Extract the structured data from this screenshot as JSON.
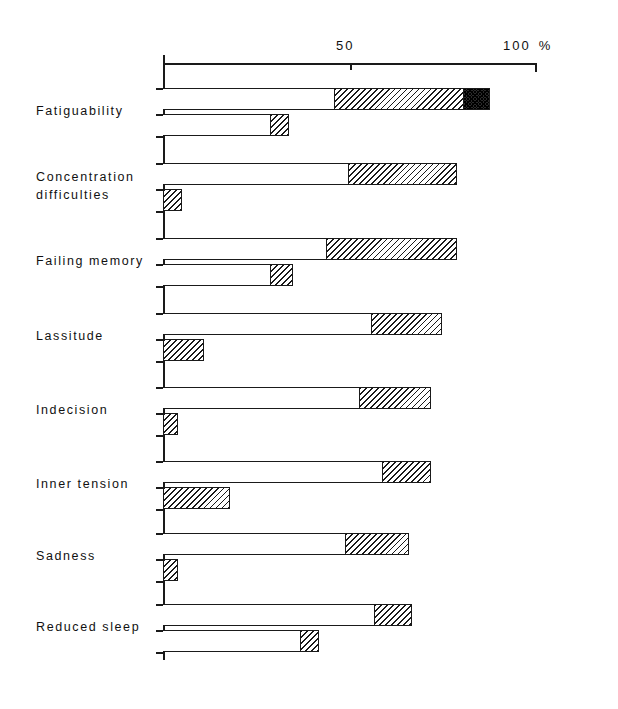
{
  "chart_data": {
    "type": "bar",
    "title": "",
    "subtitle": "",
    "xlabel": "%",
    "ylabel": "",
    "xlim": [
      0,
      100
    ],
    "xticks": [
      50,
      100
    ],
    "xticklabels": [
      "50",
      "100"
    ],
    "unit_label": "%",
    "grid": false,
    "legend_position": "none",
    "orientation": "horizontal",
    "stacked": true,
    "bars_per_category": 2,
    "segment_names": [
      "white",
      "hatched",
      "dark"
    ],
    "categories": [
      "Fatiguability",
      "Concentration difficulties",
      "Failing memory",
      "Lassitude",
      "Indecision",
      "Inner tension",
      "Sadness",
      "Reduced sleep"
    ],
    "category_lines": [
      [
        "Fatiguability"
      ],
      [
        "Concentration",
        "difficulties"
      ],
      [
        "Failing memory"
      ],
      [
        "Lassitude"
      ],
      [
        "Indecision"
      ],
      [
        "Inner tension"
      ],
      [
        "Sadness"
      ],
      [
        "Reduced sleep"
      ]
    ],
    "rows": [
      {
        "category": "Fatiguability",
        "upper": {
          "white_end": 46,
          "hatched_end": 81,
          "dark_end": 88,
          "total": 88
        },
        "lower": {
          "white_end": 29,
          "hatched_end": 34,
          "dark_end": 34,
          "total": 34
        }
      },
      {
        "category": "Concentration difficulties",
        "upper": {
          "white_end": 50,
          "hatched_end": 79,
          "dark_end": 79,
          "total": 79
        },
        "lower": {
          "white_end": 0,
          "hatched_end": 5,
          "dark_end": 5,
          "total": 5
        }
      },
      {
        "category": "Failing memory",
        "upper": {
          "white_end": 44,
          "hatched_end": 79,
          "dark_end": 79,
          "total": 79
        },
        "lower": {
          "white_end": 29,
          "hatched_end": 35,
          "dark_end": 35,
          "total": 35
        }
      },
      {
        "category": "Lassitude",
        "upper": {
          "white_end": 56,
          "hatched_end": 75,
          "dark_end": 75,
          "total": 75
        },
        "lower": {
          "white_end": 0,
          "hatched_end": 11,
          "dark_end": 11,
          "total": 11
        }
      },
      {
        "category": "Indecision",
        "upper": {
          "white_end": 53,
          "hatched_end": 72,
          "dark_end": 72,
          "total": 72
        },
        "lower": {
          "white_end": 0,
          "hatched_end": 4,
          "dark_end": 4,
          "total": 4
        }
      },
      {
        "category": "Inner tension",
        "upper": {
          "white_end": 59,
          "hatched_end": 72,
          "dark_end": 72,
          "total": 72
        },
        "lower": {
          "white_end": 0,
          "hatched_end": 18,
          "dark_end": 18,
          "total": 18
        }
      },
      {
        "category": "Sadness",
        "upper": {
          "white_end": 49,
          "hatched_end": 66,
          "dark_end": 66,
          "total": 66
        },
        "lower": {
          "white_end": 0,
          "hatched_end": 4,
          "dark_end": 4,
          "total": 4
        }
      },
      {
        "category": "Reduced sleep",
        "upper": {
          "white_end": 57,
          "hatched_end": 67,
          "dark_end": 67,
          "total": 67
        },
        "lower": {
          "white_end": 37,
          "hatched_end": 42,
          "dark_end": 42,
          "total": 42
        }
      }
    ],
    "colors": {
      "axis": "#1a1a1a",
      "white_segment": "#ffffff",
      "hatched_segment": "#1a1a1a",
      "dark_segment": "#2b2b2b",
      "background": "#ffffff"
    }
  }
}
